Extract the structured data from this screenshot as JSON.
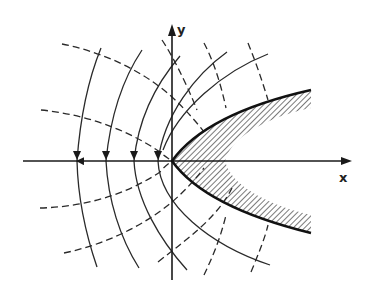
{
  "diagram": {
    "axes": {
      "x_label": "x",
      "y_label": "y"
    },
    "colors": {
      "line": "#2a2a2a",
      "background": "#ffffff",
      "hatch": "#333333"
    },
    "legend": {
      "solid_lines": "field lines",
      "dashed_lines": "equipotential lines",
      "thick_curve": "parabolic boundary",
      "hatched_region": "material region"
    }
  }
}
